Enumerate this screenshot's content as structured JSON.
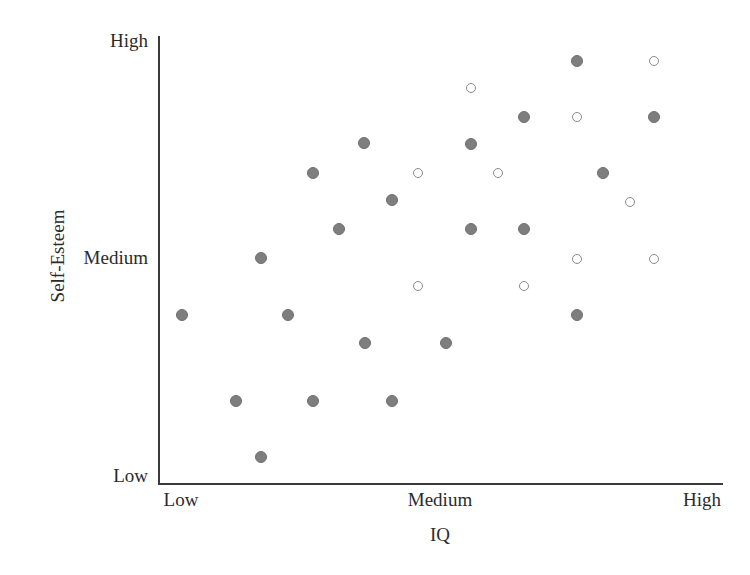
{
  "chart_data": {
    "type": "scatter",
    "title": "",
    "xlabel": "IQ",
    "ylabel": "Self-Esteem",
    "grid": false,
    "legend": "none",
    "x_tick_labels": [
      "Low",
      "Medium",
      "High"
    ],
    "y_tick_labels": [
      "Low",
      "Medium",
      "High"
    ],
    "x_tick_positions": [
      0,
      50,
      100
    ],
    "y_tick_positions": [
      0,
      50,
      100
    ],
    "xlim": [
      -4,
      104
    ],
    "ylim": [
      -4,
      104
    ],
    "series": [
      {
        "name": "filled-circle-points",
        "marker": "filled-circle",
        "color": "#7e7e7e",
        "count": 21,
        "points": [
          {
            "x": 4.2,
            "y": 27.4
          },
          {
            "x": 13.8,
            "y": 18.5
          },
          {
            "x": 18.2,
            "y": 45.8
          },
          {
            "x": 18.2,
            "y": 5.8
          },
          {
            "x": 23.4,
            "y": 18.5
          },
          {
            "x": 27.3,
            "y": 69.4
          },
          {
            "x": 32.2,
            "y": 45.8
          },
          {
            "x": 32.2,
            "y": 18.5
          },
          {
            "x": 36.5,
            "y": 31.5
          },
          {
            "x": 37.2,
            "y": 81.3
          },
          {
            "x": 41.4,
            "y": 54.2
          },
          {
            "x": 41.4,
            "y": 31.5
          },
          {
            "x": 45.8,
            "y": 69.4
          },
          {
            "x": 51.5,
            "y": 31.5
          },
          {
            "x": 55.1,
            "y": 81.3
          },
          {
            "x": 55.1,
            "y": 54.2
          },
          {
            "x": 64.8,
            "y": 54.2
          },
          {
            "x": 64.8,
            "y": 87.5
          },
          {
            "x": 74.2,
            "y": 93.5
          },
          {
            "x": 74.2,
            "y": 45.8
          },
          {
            "x": 87.8,
            "y": 87.5
          }
        ]
      },
      {
        "name": "open-circle-points",
        "marker": "open-circle",
        "color": "#8a8a8a",
        "count": 10,
        "points": [
          {
            "x": 46.0,
            "y": 69.4
          },
          {
            "x": 46.0,
            "y": 43.9
          },
          {
            "x": 55.9,
            "y": 90.5
          },
          {
            "x": 60.2,
            "y": 69.4
          },
          {
            "x": 64.8,
            "y": 43.9
          },
          {
            "x": 74.2,
            "y": 87.5
          },
          {
            "x": 74.2,
            "y": 49.9
          },
          {
            "x": 83.6,
            "y": 62.8
          },
          {
            "x": 87.8,
            "y": 93.5
          },
          {
            "x": 87.8,
            "y": 49.9
          }
        ]
      }
    ],
    "marker_pixel_positions": {
      "note": "pixel centers as rendered",
      "filled": [
        [
          577,
          61
        ],
        [
          524,
          117
        ],
        [
          654,
          117
        ],
        [
          364,
          143
        ],
        [
          471,
          144
        ],
        [
          313,
          173
        ],
        [
          603,
          173
        ],
        [
          392,
          200
        ],
        [
          339,
          229
        ],
        [
          471,
          229
        ],
        [
          524,
          229
        ],
        [
          261,
          258
        ],
        [
          182,
          315
        ],
        [
          288,
          315
        ],
        [
          577,
          315
        ],
        [
          365,
          343
        ],
        [
          446,
          343
        ],
        [
          236,
          401
        ],
        [
          313,
          401
        ],
        [
          392,
          401
        ],
        [
          261,
          457
        ]
      ],
      "open": [
        [
          654,
          61
        ],
        [
          471,
          88
        ],
        [
          577,
          117
        ],
        [
          418,
          173
        ],
        [
          498,
          173
        ],
        [
          630,
          202
        ],
        [
          577,
          259
        ],
        [
          654,
          259
        ],
        [
          418,
          286
        ],
        [
          524,
          286
        ]
      ]
    }
  },
  "axes": {
    "y": {
      "title": "Self-Esteem",
      "ticks": [
        {
          "label": "High"
        },
        {
          "label": "Medium"
        },
        {
          "label": "Low"
        }
      ]
    },
    "x": {
      "title": "IQ",
      "ticks": [
        {
          "label": "Low"
        },
        {
          "label": "Medium"
        },
        {
          "label": "High"
        }
      ]
    }
  },
  "colors": {
    "axis": "#3a3a3a",
    "text": "#2b2b2b",
    "filled_marker": "#7e7e7e",
    "open_marker_stroke": "#8a8a8a",
    "background": "#ffffff"
  }
}
